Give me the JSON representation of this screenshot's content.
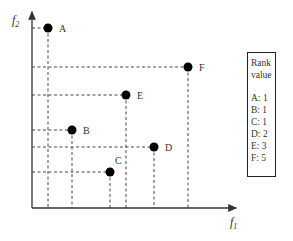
{
  "axes": {
    "x_label": "f",
    "x_sub": "1",
    "y_label": "f",
    "y_sub": "2"
  },
  "points": [
    {
      "label": "A",
      "x": 48,
      "y": 28
    },
    {
      "label": "B",
      "x": 72,
      "y": 130
    },
    {
      "label": "C",
      "x": 110,
      "y": 172
    },
    {
      "label": "D",
      "x": 154,
      "y": 147
    },
    {
      "label": "E",
      "x": 126,
      "y": 95
    },
    {
      "label": "F",
      "x": 188,
      "y": 67
    }
  ],
  "rank_box": {
    "title_line1": "Rank",
    "title_line2": "value",
    "entries": [
      "A: 1",
      "B: 1",
      "C: 1",
      "D: 2",
      "E: 3",
      "F: 5"
    ]
  },
  "colors": {
    "line": "#333333",
    "point": "#000000"
  }
}
